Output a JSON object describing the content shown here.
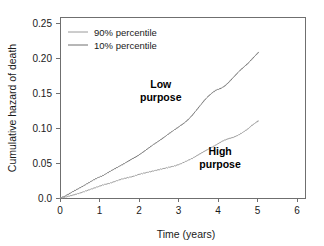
{
  "chart_data": {
    "type": "line",
    "title": "",
    "subtitle": "",
    "xlabel": "Time (years)",
    "ylabel": "Cumulative hazard of death",
    "xlim": [
      0,
      6.2
    ],
    "ylim": [
      0.0,
      0.26
    ],
    "xticks": [
      0,
      1,
      2,
      3,
      4,
      5,
      6
    ],
    "xtick_labels": [
      "0",
      "1",
      "2",
      "3",
      "4",
      "5",
      "6"
    ],
    "yticks": [
      0.0,
      0.05,
      0.1,
      0.15,
      0.2,
      0.25
    ],
    "ytick_labels": [
      "0.0",
      "0.05",
      "0.10",
      "0.15",
      "0.20",
      "0.25"
    ],
    "grid": false,
    "legend_position": "top-left",
    "legend_entries": [
      {
        "label": "90% percentile",
        "color": "#9a9a9a"
      },
      {
        "label": "10% percentile",
        "color": "#6e6e6e"
      }
    ],
    "annotations": [
      {
        "text_line1": "Low",
        "text_line2": "purpose",
        "x": 2.55,
        "y": 0.158
      },
      {
        "text_line1": "High",
        "text_line2": "purpose",
        "x": 4.05,
        "y": 0.062
      }
    ],
    "series": [
      {
        "name": "10% percentile",
        "annotation": "Low purpose",
        "color": "#7a7a7a",
        "x": [
          0.0,
          0.1,
          0.2,
          0.32,
          0.45,
          0.58,
          0.7,
          0.82,
          0.95,
          1.08,
          1.2,
          1.32,
          1.45,
          1.58,
          1.7,
          1.82,
          1.95,
          2.08,
          2.2,
          2.32,
          2.45,
          2.58,
          2.7,
          2.82,
          2.95,
          3.05,
          3.15,
          3.25,
          3.35,
          3.45,
          3.55,
          3.65,
          3.75,
          3.85,
          3.95,
          4.05,
          4.15,
          4.25,
          4.35,
          4.45,
          4.55,
          4.65,
          4.75,
          4.85,
          4.95,
          5.02
        ],
        "y": [
          0.0,
          0.002,
          0.005,
          0.009,
          0.013,
          0.017,
          0.021,
          0.025,
          0.029,
          0.032,
          0.036,
          0.04,
          0.044,
          0.048,
          0.052,
          0.056,
          0.06,
          0.065,
          0.07,
          0.075,
          0.08,
          0.085,
          0.09,
          0.095,
          0.1,
          0.104,
          0.108,
          0.113,
          0.119,
          0.126,
          0.133,
          0.14,
          0.146,
          0.151,
          0.155,
          0.157,
          0.16,
          0.165,
          0.171,
          0.177,
          0.183,
          0.188,
          0.193,
          0.199,
          0.205,
          0.209
        ]
      },
      {
        "name": "90% percentile",
        "annotation": "High purpose",
        "color": "#9e9e9e",
        "x": [
          0.0,
          0.12,
          0.25,
          0.38,
          0.5,
          0.65,
          0.8,
          0.95,
          1.1,
          1.25,
          1.4,
          1.55,
          1.7,
          1.85,
          2.0,
          2.15,
          2.3,
          2.45,
          2.6,
          2.75,
          2.9,
          3.05,
          3.2,
          3.35,
          3.5,
          3.62,
          3.75,
          3.88,
          4.0,
          4.12,
          4.25,
          4.38,
          4.5,
          4.62,
          4.75,
          4.85,
          4.95,
          5.02
        ],
        "y": [
          0.0,
          0.001,
          0.003,
          0.005,
          0.007,
          0.01,
          0.013,
          0.016,
          0.019,
          0.021,
          0.024,
          0.027,
          0.029,
          0.031,
          0.034,
          0.036,
          0.038,
          0.04,
          0.042,
          0.044,
          0.046,
          0.049,
          0.053,
          0.057,
          0.062,
          0.066,
          0.07,
          0.074,
          0.078,
          0.082,
          0.085,
          0.087,
          0.09,
          0.094,
          0.099,
          0.104,
          0.108,
          0.111
        ]
      }
    ]
  },
  "colors": {
    "axis": "#6f6f6f",
    "text": "#1a1a1a",
    "background": "#ffffff"
  }
}
